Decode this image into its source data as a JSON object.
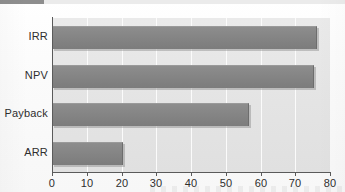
{
  "header": {
    "strip_dark_color": "#8e8e8e",
    "strip_light_color": "#ebebeb"
  },
  "chart_data": {
    "type": "bar",
    "orientation": "horizontal",
    "title": "",
    "subtitle": "",
    "xlabel": "",
    "ylabel": "",
    "categories": [
      "IRR",
      "NPV",
      "Payback",
      "ARR"
    ],
    "values": [
      76,
      75,
      56.5,
      20
    ],
    "series": [
      {
        "name": "",
        "values": [
          76,
          75,
          56.5,
          20
        ]
      }
    ],
    "xlim": [
      0,
      80
    ],
    "ylim": [
      0,
      4
    ],
    "xticks": [
      0,
      10,
      20,
      30,
      40,
      50,
      60,
      70,
      80
    ],
    "xtick_labels": [
      "0",
      "10",
      "20",
      "30",
      "40",
      "50",
      "60",
      "70",
      "80"
    ],
    "ytick_labels": [
      "IRR",
      "NPV",
      "Payback",
      "ARR"
    ],
    "grid": true,
    "grid_axis": "x",
    "grid_color": "#fbfbfb",
    "legend": false,
    "legend_position": "none",
    "annotations": [],
    "colors": {
      "bar_fill": "#868686",
      "bar_edge": "#6d6d6d",
      "plot_background": "#e6e6e6",
      "axis_line": "#5a5a5a",
      "tick_text": "#2e2e2e",
      "page_background": "#fdfdfd"
    }
  }
}
